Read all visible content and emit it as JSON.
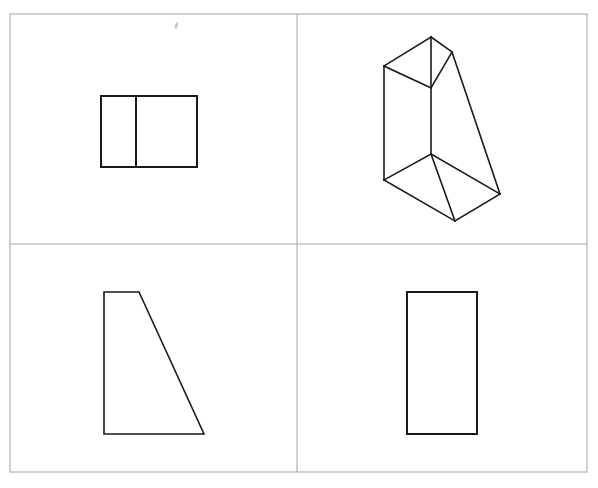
{
  "page": {
    "title": "Orthographic Views and Isometric Drawing Worksheet",
    "background_color": "#ffffff",
    "width": 598,
    "height": 488
  },
  "frame": {
    "name": "outer-border",
    "color": "#a9a9a9",
    "x": 10,
    "y": 14,
    "width": 577,
    "height": 458,
    "stroke_width": 1.1
  },
  "dividers": {
    "vertical": {
      "x": 297,
      "y1": 14,
      "y2": 472,
      "color": "#a9a9a9"
    },
    "horizontal": {
      "y": 244,
      "x1": 10,
      "x2": 587,
      "color": "#a9a9a9"
    }
  },
  "ink_color": "#1a1a1a",
  "quadrants": [
    {
      "id": "top-left",
      "label": "Top view — rectangle divided by vertical line",
      "shape_type": "rectangle-with-divider",
      "bounds": {
        "x": 101,
        "y": 96,
        "width": 96,
        "height": 71
      },
      "divider_x": 136,
      "outline_points": "101,96 197,96 197,167 101,167",
      "divider_points": "136,96 136,167"
    },
    {
      "id": "top-right",
      "label": "Isometric pictorial — wedge / triangular prism",
      "shape_type": "isometric-wedge-prism",
      "vertices": {
        "top_apex": [
          431,
          37
        ],
        "top_left": [
          384,
          66
        ],
        "top_right": [
          452,
          52
        ],
        "mid_center": [
          431,
          154
        ],
        "bottom_left": [
          384,
          180
        ],
        "bottom_right": [
          500,
          194
        ],
        "bottom_front": [
          455,
          221
        ]
      },
      "edges": [
        "431,37 384,66",
        "431,37 452,52",
        "384,66 431,88",
        "431,88 452,52",
        "431,37 431,154",
        "384,66 384,180",
        "452,52 500,194",
        "431,154 384,180",
        "431,154 500,194",
        "431,154 455,221",
        "384,180 455,221",
        "455,221 500,194"
      ]
    },
    {
      "id": "bottom-left",
      "label": "Side view — right trapezoid",
      "shape_type": "trapezoid",
      "outline_points": "104,292 139,292 204,434 104,434",
      "bounds": {
        "x": 104,
        "y": 292,
        "width": 100,
        "height": 142
      }
    },
    {
      "id": "bottom-right",
      "label": "Front view — tall rectangle",
      "shape_type": "rectangle",
      "outline_points": "407,292 477,292 477,434 407,434",
      "bounds": {
        "x": 407,
        "y": 292,
        "width": 70,
        "height": 142
      }
    }
  ],
  "artifacts": [
    {
      "name": "scan-speck",
      "x": 175,
      "y": 22,
      "width": 3,
      "height": 7,
      "color": "#c8c8c8"
    }
  ]
}
